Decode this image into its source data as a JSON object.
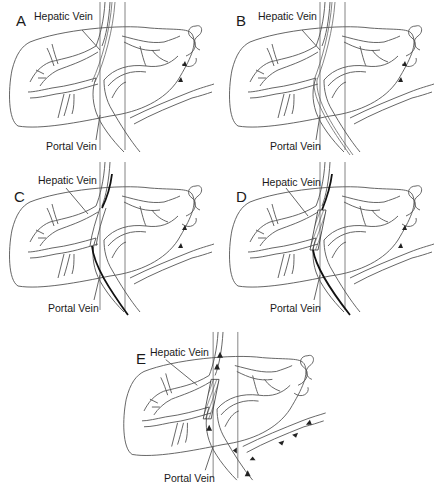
{
  "figure": {
    "panels": [
      {
        "id": "A",
        "letter": "A",
        "hepatic_label": "Hepatic Vein",
        "portal_label": "Portal Vein",
        "stage": "needle puncture from hepatic vein toward portal vein"
      },
      {
        "id": "B",
        "letter": "B",
        "hepatic_label": "Hepatic Vein",
        "portal_label": "Portal Vein",
        "stage": "guidewire advanced into portal vein"
      },
      {
        "id": "C",
        "letter": "C",
        "hepatic_label": "Hepatic Vein",
        "portal_label": "Portal Vein",
        "stage": "balloon dilation of tract"
      },
      {
        "id": "D",
        "letter": "D",
        "hepatic_label": "Hepatic Vein",
        "portal_label": "Portal Vein",
        "stage": "stent placed across tract"
      },
      {
        "id": "E",
        "letter": "E",
        "hepatic_label": "Hepatic Vein",
        "portal_label": "Portal Vein",
        "stage": "shunt flow from portal to hepatic vein"
      }
    ],
    "colors": {
      "line": "#555555",
      "wire": "#111111",
      "text": "#1a1a1a",
      "background": "#ffffff"
    }
  }
}
